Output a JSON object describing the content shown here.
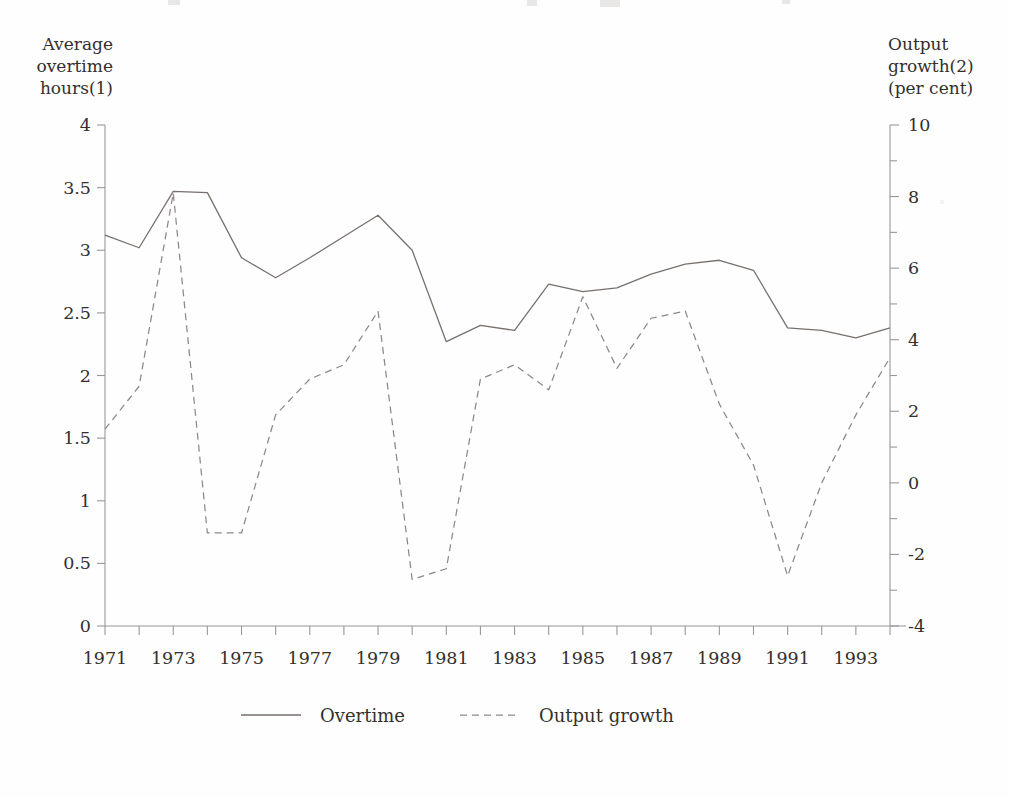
{
  "chart_data": {
    "type": "line",
    "title": "",
    "subtitle": "",
    "xlabel": "",
    "ylabel": "Average overtime hours(1)",
    "y2label": "Output growth(2) (per cent)",
    "grid": false,
    "legend_position": "bottom",
    "x": [
      1971,
      1972,
      1973,
      1974,
      1975,
      1976,
      1977,
      1978,
      1979,
      1980,
      1981,
      1982,
      1983,
      1984,
      1985,
      1986,
      1987,
      1988,
      1989,
      1990,
      1991,
      1992,
      1993,
      1994
    ],
    "xlim": [
      1971,
      1994
    ],
    "xticks_labeled": [
      "1971",
      "1973",
      "1975",
      "1977",
      "1979",
      "1981",
      "1983",
      "1985",
      "1987",
      "1989",
      "1991",
      "1993"
    ],
    "xtick_values_labeled": [
      1971,
      1973,
      1975,
      1977,
      1979,
      1981,
      1983,
      1985,
      1987,
      1989,
      1991,
      1993
    ],
    "left_axis": {
      "label_lines": [
        "Average",
        "overtime",
        "hours(1)"
      ],
      "ylim": [
        0,
        4
      ],
      "ticks": [
        0,
        0.5,
        1,
        1.5,
        2,
        2.5,
        3,
        3.5,
        4
      ],
      "ticklabels": [
        "0",
        "0.5",
        "1",
        "1.5",
        "2",
        "2.5",
        "3",
        "3.5",
        "4"
      ]
    },
    "right_axis": {
      "label_lines": [
        "Output",
        "growth(2)",
        "(per cent)"
      ],
      "ylim": [
        -4,
        10
      ],
      "ticks": [
        -4,
        -2,
        0,
        2,
        4,
        6,
        8,
        10
      ],
      "ticklabels": [
        "-4",
        "-2",
        "0",
        "2",
        "4",
        "6",
        "8",
        "10"
      ],
      "minor_ticks": [
        -3,
        -1,
        1,
        3,
        5,
        7,
        9
      ]
    },
    "series": [
      {
        "name": "Overtime",
        "style": "solid",
        "axis": "left",
        "color": "#77716e",
        "values": [
          3.12,
          3.02,
          3.47,
          3.46,
          2.94,
          2.78,
          2.94,
          3.11,
          3.28,
          3.0,
          2.27,
          2.4,
          2.36,
          2.73,
          2.67,
          2.7,
          2.81,
          2.89,
          2.92,
          2.84,
          2.38,
          2.36,
          2.3,
          2.38
        ]
      },
      {
        "name": "Output growth",
        "style": "dashed",
        "axis": "right",
        "color": "#8d8886",
        "values": [
          1.5,
          2.7,
          8.1,
          -1.4,
          -1.4,
          1.9,
          2.9,
          3.3,
          4.8,
          -2.7,
          -2.4,
          2.9,
          3.3,
          2.6,
          5.2,
          3.2,
          4.6,
          4.8,
          2.2,
          0.5,
          -2.6,
          0.0,
          1.9,
          3.5
        ]
      }
    ],
    "legend": [
      {
        "label": "Overtime",
        "style": "solid"
      },
      {
        "label": "Output growth",
        "style": "dashed"
      }
    ]
  }
}
